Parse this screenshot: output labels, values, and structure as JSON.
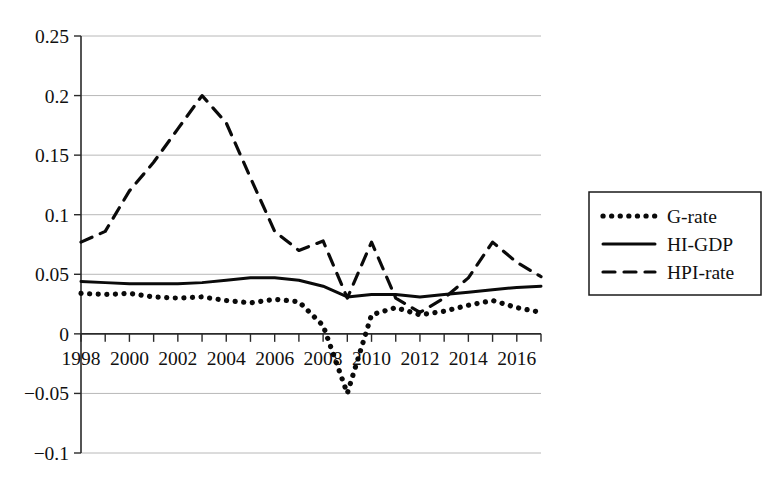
{
  "chart_data": {
    "type": "line",
    "title": "",
    "subtitle": "",
    "xlabel": "",
    "ylabel": "",
    "xlim": [
      1998,
      2017
    ],
    "ylim": [
      -0.1,
      0.25
    ],
    "grid": true,
    "legend_position": "right",
    "y_ticks": [
      0.25,
      0.2,
      0.15,
      0.1,
      0.05,
      0,
      -0.05,
      -0.1
    ],
    "y_tick_labels": [
      "0.25",
      "0.2",
      "0.15",
      "0.1",
      "0.05",
      "0",
      "−0.05",
      "−0.1"
    ],
    "x_ticks": [
      1998,
      2000,
      2002,
      2004,
      2006,
      2008,
      2010,
      2012,
      2014,
      2016
    ],
    "x_tick_labels": [
      "1998",
      "2000",
      "2002",
      "2004",
      "2006",
      "2008",
      "2010",
      "2012",
      "2014",
      "2016"
    ],
    "x_minor_ticks": [
      1999,
      2001,
      2003,
      2005,
      2007,
      2009,
      2011,
      2013,
      2015,
      2017
    ],
    "x": [
      1998,
      1999,
      2000,
      2001,
      2002,
      2003,
      2004,
      2005,
      2006,
      2007,
      2008,
      2009,
      2010,
      2011,
      2012,
      2013,
      2014,
      2015,
      2016,
      2017
    ],
    "series": [
      {
        "name": "G-rate",
        "style": "dotted",
        "color": "#0a0a0a",
        "values": [
          0.034,
          0.033,
          0.034,
          0.031,
          0.03,
          0.031,
          0.028,
          0.026,
          0.029,
          0.027,
          0.007,
          -0.05,
          0.016,
          0.022,
          0.016,
          0.019,
          0.024,
          0.028,
          0.022,
          0.018
        ]
      },
      {
        "name": "HI-GDP",
        "style": "solid",
        "color": "#0a0a0a",
        "values": [
          0.044,
          0.043,
          0.042,
          0.042,
          0.042,
          0.043,
          0.045,
          0.047,
          0.047,
          0.045,
          0.04,
          0.031,
          0.033,
          0.033,
          0.031,
          0.033,
          0.035,
          0.037,
          0.039,
          0.04
        ]
      },
      {
        "name": "HPI-rate",
        "style": "dashed",
        "color": "#0a0a0a",
        "values": [
          0.077,
          0.086,
          0.12,
          0.144,
          0.172,
          0.2,
          0.177,
          0.131,
          0.086,
          0.07,
          0.078,
          0.03,
          0.077,
          0.03,
          0.018,
          0.03,
          0.047,
          0.077,
          0.06,
          0.048
        ]
      }
    ]
  },
  "legend": {
    "items": [
      {
        "label": "G-rate",
        "style": "dotted"
      },
      {
        "label": "HI-GDP",
        "style": "solid"
      },
      {
        "label": "HPI-rate",
        "style": "dashed"
      }
    ]
  }
}
